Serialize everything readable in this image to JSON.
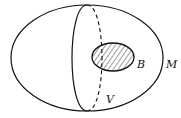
{
  "diagram": {
    "labels": {
      "outer_region": "M",
      "ball": "B",
      "cross_section": "V"
    },
    "colors": {
      "stroke": "#111111",
      "background": "#ffffff"
    }
  }
}
